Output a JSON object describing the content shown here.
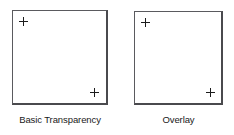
{
  "figure": {
    "background_color": "#ffffff",
    "border_color": "#5a5a5e",
    "marker_color": "#1c1c1c",
    "text_color": "#1a1a1a"
  },
  "panels": [
    {
      "id": "basic-transparency",
      "caption": "Basic Transparency",
      "markers": [
        {
          "name": "marker-top-left",
          "glyph": "+",
          "position": "top-left"
        },
        {
          "name": "marker-bottom-right",
          "glyph": "+",
          "position": "bottom-right"
        }
      ]
    },
    {
      "id": "overlay",
      "caption": "Overlay",
      "markers": [
        {
          "name": "marker-top-left",
          "glyph": "+",
          "position": "top-left"
        },
        {
          "name": "marker-bottom-right",
          "glyph": "+",
          "position": "bottom-right"
        }
      ]
    }
  ]
}
